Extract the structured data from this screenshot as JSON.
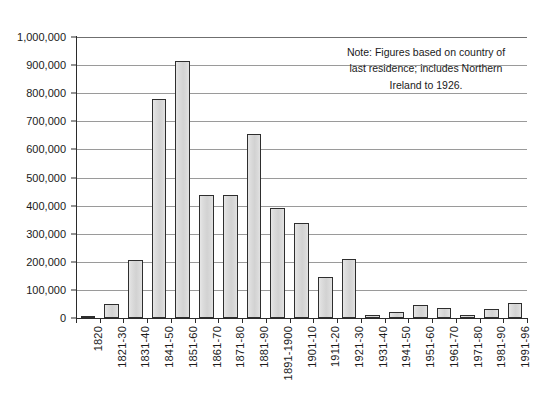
{
  "chart_data": {
    "type": "bar",
    "title": "",
    "subtitle": "",
    "xlabel": "",
    "ylabel": "",
    "ylim": [
      0,
      1000000
    ],
    "grid": true,
    "legend": "none",
    "orientation": "vertical",
    "bar_fill_color": "#d8d8d8",
    "bar_border_color": "#2e2e2e",
    "gridline_color": "#9a9a9a",
    "axis_color": "#2b2b2b",
    "background_color": "#ffffff",
    "y_ticks": [
      "0",
      "100,000",
      "200,000",
      "300,000",
      "400,000",
      "500,000",
      "600,000",
      "700,000",
      "800,000",
      "900,000",
      "1,000,000"
    ],
    "y_tick_values": [
      0,
      100000,
      200000,
      300000,
      400000,
      500000,
      600000,
      700000,
      800000,
      900000,
      1000000
    ],
    "categories": [
      "1820",
      "1821-30",
      "1831-40",
      "1841-50",
      "1851-60",
      "1861-70",
      "1871-80",
      "1881-90",
      "1891-1900",
      "1901-10",
      "1911-20",
      "1921-30",
      "1931-40",
      "1941-50",
      "1951-60",
      "1961-70",
      "1971-80",
      "1981-90",
      "1991-96"
    ],
    "values": [
      4000,
      51000,
      207000,
      781000,
      915000,
      436000,
      437000,
      655000,
      390000,
      339000,
      146000,
      211000,
      11000,
      20000,
      48000,
      34000,
      12000,
      33000,
      54000
    ]
  },
  "annotations": {
    "note": {
      "line1": "Note: Figures based on country of",
      "line2": "last residence; includes Northern",
      "line3": "Ireland to 1926."
    }
  }
}
